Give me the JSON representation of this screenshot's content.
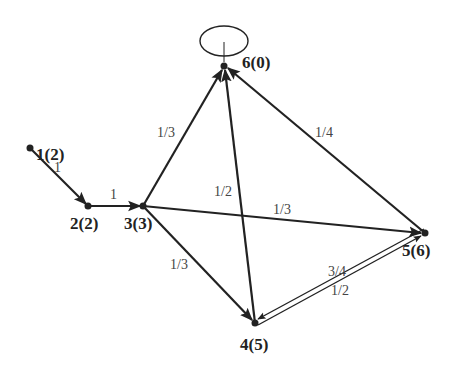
{
  "diagram": {
    "type": "directed-graph",
    "nodes": [
      {
        "id": "1",
        "label": "1(2)",
        "x": 30,
        "y": 148
      },
      {
        "id": "2",
        "label": "2(2)",
        "x": 88,
        "y": 206
      },
      {
        "id": "3",
        "label": "3(3)",
        "x": 143,
        "y": 206
      },
      {
        "id": "4",
        "label": "4(5)",
        "x": 255,
        "y": 323
      },
      {
        "id": "5",
        "label": "5(6)",
        "x": 425,
        "y": 233
      },
      {
        "id": "6",
        "label": "6(0)",
        "x": 224,
        "y": 66
      }
    ],
    "edges": [
      {
        "from": "1",
        "to": "2",
        "label": "1"
      },
      {
        "from": "2",
        "to": "3",
        "label": "1"
      },
      {
        "from": "3",
        "to": "6",
        "label": "1/3"
      },
      {
        "from": "3",
        "to": "5",
        "label": "1/3"
      },
      {
        "from": "3",
        "to": "4",
        "label": "1/3"
      },
      {
        "from": "4",
        "to": "6",
        "label": "1/2"
      },
      {
        "from": "5",
        "to": "6",
        "label": "1/4"
      },
      {
        "from": "5",
        "to": "4",
        "label": "3/4"
      },
      {
        "from": "4",
        "to": "5",
        "label": "1/2"
      },
      {
        "from": "6",
        "to": "6",
        "label": "",
        "self_loop": true
      }
    ]
  },
  "labels": {
    "n1": "1(2)",
    "n2": "2(2)",
    "n3": "3(3)",
    "n4": "4(5)",
    "n5": "5(6)",
    "n6": "6(0)",
    "e12": "1",
    "e23": "1",
    "e36": "1/3",
    "e35": "1/3",
    "e34": "1/3",
    "e46": "1/2",
    "e56": "1/4",
    "e54": "3/4",
    "e45": "1/2"
  }
}
